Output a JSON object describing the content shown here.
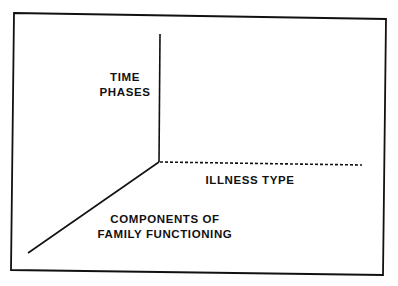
{
  "diagram": {
    "type": "three-axis conceptual model",
    "axes": [
      {
        "id": "vertical",
        "lines": [
          "TIME",
          "PHASES"
        ],
        "style": "solid"
      },
      {
        "id": "horizontal",
        "lines": [
          "ILLNESS TYPE"
        ],
        "style": "dashed"
      },
      {
        "id": "diagonal",
        "lines": [
          "COMPONENTS OF",
          "FAMILY FUNCTIONING"
        ],
        "style": "solid"
      }
    ],
    "colors": {
      "ink": "#111111",
      "background": "#ffffff"
    }
  }
}
